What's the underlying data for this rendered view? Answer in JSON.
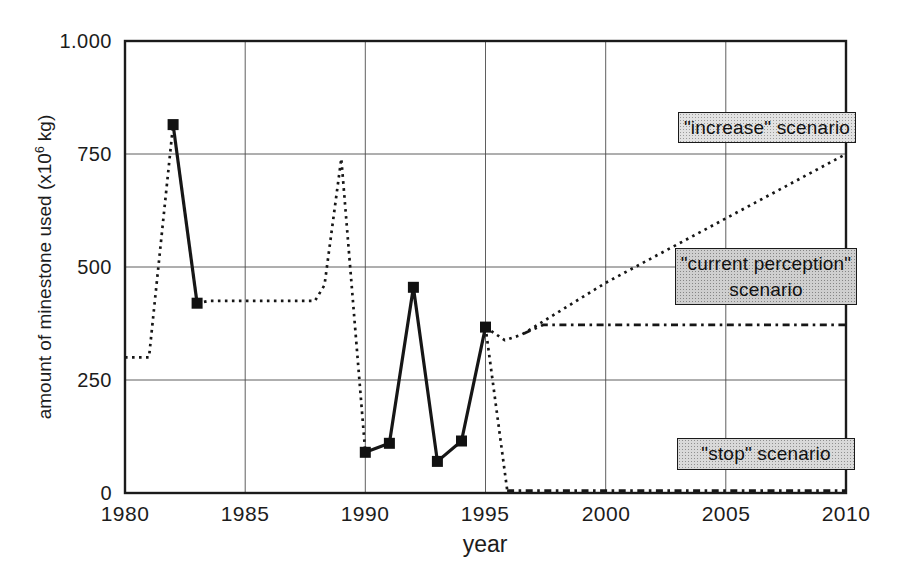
{
  "figure": {
    "background": "#ffffff",
    "ink_color": "#161616",
    "grid_color": "#4d4d4d"
  },
  "chart_data": {
    "type": "line",
    "title": "",
    "xlabel": "year",
    "ylabel": "amount of minestone used (x10⁶ kg)",
    "ylabel_parts": {
      "pre": "amount of minestone used (x10",
      "sup": "6",
      "post": " kg)"
    },
    "xlim": [
      1980,
      2010
    ],
    "ylim": [
      0,
      1000
    ],
    "grid": true,
    "x_ticks": [
      {
        "v": 1980,
        "label": "1980"
      },
      {
        "v": 1985,
        "label": "1985"
      },
      {
        "v": 1990,
        "label": "1990"
      },
      {
        "v": 1995,
        "label": "1995"
      },
      {
        "v": 2000,
        "label": "2000"
      },
      {
        "v": 2005,
        "label": "2005"
      },
      {
        "v": 2010,
        "label": "2010"
      }
    ],
    "y_ticks": [
      {
        "v": 0,
        "label": "0"
      },
      {
        "v": 250,
        "label": "250"
      },
      {
        "v": 500,
        "label": "500"
      },
      {
        "v": 750,
        "label": "750"
      },
      {
        "v": 1000,
        "label": "1.000"
      }
    ],
    "series": [
      {
        "name": "historical-dotted-1980-1982",
        "style": "dotted",
        "markers": false,
        "points": [
          [
            1980,
            300
          ],
          [
            1981,
            300
          ],
          [
            1982,
            815
          ]
        ]
      },
      {
        "name": "historical-dotted-1983-1990",
        "style": "dotted",
        "markers": false,
        "points": [
          [
            1983,
            420
          ],
          [
            1983.5,
            425
          ],
          [
            1987.9,
            425
          ],
          [
            1988.3,
            460
          ],
          [
            1989,
            740
          ],
          [
            1990,
            90
          ]
        ]
      },
      {
        "name": "measured-solid-1982-1983",
        "style": "solid",
        "markers": true,
        "points": [
          [
            1982,
            815
          ],
          [
            1983,
            420
          ]
        ]
      },
      {
        "name": "measured-solid-1990-1995",
        "style": "solid",
        "markers": true,
        "points": [
          [
            1990,
            90
          ],
          [
            1991,
            110
          ],
          [
            1992,
            455
          ],
          [
            1993,
            70
          ],
          [
            1994,
            115
          ],
          [
            1995,
            367
          ]
        ]
      },
      {
        "name": "increase-scenario",
        "style": "dotted",
        "markers": false,
        "points": [
          [
            1995,
            367
          ],
          [
            1995.8,
            338
          ],
          [
            1996.5,
            350
          ],
          [
            2000,
            465
          ],
          [
            2010,
            750
          ]
        ]
      },
      {
        "name": "current-perception-scenario",
        "style": "dashed",
        "markers": false,
        "points": [
          [
            1996.6,
            353
          ],
          [
            1997.4,
            372
          ],
          [
            2010,
            372
          ]
        ]
      },
      {
        "name": "stop-scenario-drop",
        "style": "dotted",
        "markers": false,
        "points": [
          [
            1995,
            367
          ],
          [
            1995.9,
            8
          ]
        ]
      },
      {
        "name": "stop-scenario-flat",
        "style": "dashed",
        "markers": false,
        "points": [
          [
            1995.9,
            5
          ],
          [
            2010,
            5
          ]
        ]
      }
    ],
    "legend_position": "none",
    "annotations": [
      {
        "name": "increase",
        "lines": [
          "\"increase\" scenario"
        ]
      },
      {
        "name": "current-perception",
        "lines": [
          "\"current perception\"",
          "scenario"
        ]
      },
      {
        "name": "stop",
        "lines": [
          "\"stop\" scenario"
        ]
      }
    ]
  }
}
